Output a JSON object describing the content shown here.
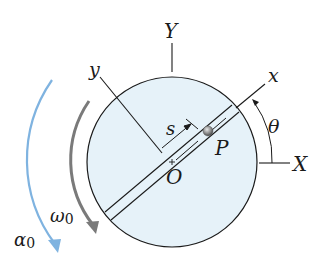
{
  "diagram": {
    "type": "rotating-disk-kinematics",
    "labels": {
      "Y": "Y",
      "X": "X",
      "y": "y",
      "x": "x",
      "s": "s",
      "P": "P",
      "O": "O",
      "theta": "θ",
      "omega_symbol": "ω",
      "omega_sub": "0",
      "alpha_symbol": "α",
      "alpha_sub": "0"
    },
    "colors": {
      "disk_fill": "#e6f2f9",
      "stroke": "#1a1a1a",
      "omega_arrow": "#7a7a7a",
      "alpha_arrow": "#7fb3e0",
      "particle": "#8c8c8c"
    },
    "geometry": {
      "disk_center": [
        172,
        162
      ],
      "disk_radius": 85,
      "slot_angle_deg": 40
    }
  }
}
